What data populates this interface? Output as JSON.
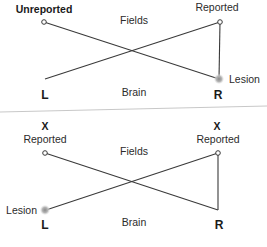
{
  "diagram": {
    "type": "visual-field-crossing-diagram",
    "panels": [
      {
        "id": "top",
        "fields_label": "Fields",
        "brain_label": "Brain",
        "left_side_label": "L",
        "right_side_label": "R",
        "left_field": {
          "marker": "",
          "status_label": "Unreported",
          "status_bold": true
        },
        "right_field": {
          "marker": "",
          "status_label": "Reported",
          "status_bold": false
        },
        "lesion": {
          "label": "Lesion",
          "hemisphere": "R"
        }
      },
      {
        "id": "bottom",
        "fields_label": "Fields",
        "brain_label": "Brain",
        "left_side_label": "L",
        "right_side_label": "R",
        "left_field": {
          "marker": "X",
          "status_label": "Reported",
          "status_bold": false
        },
        "right_field": {
          "marker": "X",
          "status_label": "Reported",
          "status_bold": false
        },
        "lesion": {
          "label": "Lesion",
          "hemisphere": "L"
        }
      }
    ],
    "colors": {
      "line": "#3a3a3a",
      "text": "#2b2b2b",
      "divider": "#c8c8c8",
      "lesion": "#9a9a9a"
    }
  }
}
